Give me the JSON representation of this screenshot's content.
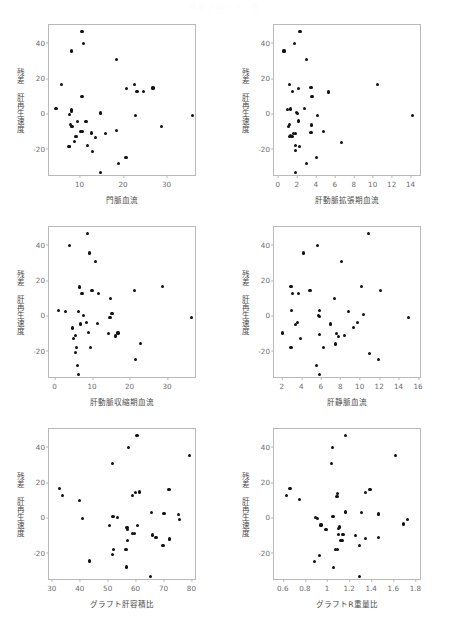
{
  "header": {
    "watermark": "残差プロット一覧"
  },
  "figure": {
    "ylabel_common": "残差 肝再生速度"
  },
  "chart_data": [
    {
      "type": "scatter",
      "title": "",
      "xlabel": "門脈血流",
      "ylabel": "残差 肝再生速度",
      "xlim": [
        3,
        37
      ],
      "ylim": [
        -36,
        50
      ],
      "xticks": [
        10,
        20,
        30
      ],
      "yticks": [
        40,
        20,
        0,
        -20
      ],
      "grid": false,
      "legend": "none",
      "points": [
        [
          10.6,
          46.5
        ],
        [
          10.9,
          39.7
        ],
        [
          8.2,
          35.3
        ],
        [
          18.6,
          30.6
        ],
        [
          5.9,
          16.2
        ],
        [
          22.6,
          16.3
        ],
        [
          20.8,
          14.0
        ],
        [
          26.9,
          14.4
        ],
        [
          23.2,
          12.4
        ],
        [
          24.7,
          12.2
        ],
        [
          10.6,
          9.5
        ],
        [
          4.6,
          2.6
        ],
        [
          8.1,
          2.0
        ],
        [
          8.2,
          1.5
        ],
        [
          8.1,
          0.9
        ],
        [
          14.9,
          0.2
        ],
        [
          7.7,
          -0.7
        ],
        [
          22.9,
          -1.3
        ],
        [
          35.9,
          -1.4
        ],
        [
          9.5,
          -4.4
        ],
        [
          11.5,
          -4.7
        ],
        [
          7.9,
          -6.5
        ],
        [
          8.3,
          -7.2
        ],
        [
          28.9,
          -7.3
        ],
        [
          18.6,
          -9.6
        ],
        [
          10.2,
          -10.2
        ],
        [
          10.6,
          -10.4
        ],
        [
          12.7,
          -11.1
        ],
        [
          16.0,
          -11.4
        ],
        [
          9.2,
          -12.9
        ],
        [
          13.6,
          -13.5
        ],
        [
          8.9,
          -16.1
        ],
        [
          11.9,
          -18.0
        ],
        [
          7.6,
          -18.8
        ],
        [
          7.8,
          -18.9
        ],
        [
          12.9,
          -21.6
        ],
        [
          20.7,
          -25.0
        ],
        [
          18.9,
          -28.2
        ],
        [
          14.8,
          -33.3
        ]
      ]
    },
    {
      "type": "scatter",
      "title": "",
      "xlabel": "肝動脈拡張期血流",
      "ylabel": "残差 肝再生速度",
      "xlim": [
        -0.4,
        15.2
      ],
      "ylim": [
        -36,
        50
      ],
      "xticks": [
        0,
        2,
        4,
        6,
        8,
        10,
        12,
        14
      ],
      "yticks": [
        40,
        20,
        0,
        -20
      ],
      "grid": false,
      "legend": "none",
      "points": [
        [
          2.35,
          46.5
        ],
        [
          1.75,
          39.7
        ],
        [
          0.65,
          35.3
        ],
        [
          3.0,
          30.6
        ],
        [
          1.25,
          16.2
        ],
        [
          10.5,
          16.3
        ],
        [
          2.15,
          14.0
        ],
        [
          3.5,
          14.5
        ],
        [
          1.55,
          12.4
        ],
        [
          5.35,
          12.1
        ],
        [
          3.6,
          9.5
        ],
        [
          1.0,
          2.2
        ],
        [
          1.35,
          2.5
        ],
        [
          2.85,
          2.7
        ],
        [
          1.95,
          0.4
        ],
        [
          2.05,
          0.0
        ],
        [
          14.2,
          -1.2
        ],
        [
          4.2,
          -1.4
        ],
        [
          2.2,
          -4.3
        ],
        [
          1.25,
          -6.4
        ],
        [
          3.55,
          -6.6
        ],
        [
          1.15,
          -7.5
        ],
        [
          4.8,
          -10.2
        ],
        [
          3.5,
          -10.6
        ],
        [
          1.65,
          -11.3
        ],
        [
          1.9,
          -11.5
        ],
        [
          1.3,
          -12.4
        ],
        [
          1.25,
          -13.0
        ],
        [
          1.5,
          -13.3
        ],
        [
          1.85,
          -18.0
        ],
        [
          2.3,
          -18.6
        ],
        [
          6.7,
          -16.3
        ],
        [
          1.9,
          -21.2
        ],
        [
          4.05,
          -25.0
        ],
        [
          3.05,
          -28.3
        ],
        [
          1.85,
          -33.4
        ]
      ]
    },
    {
      "type": "scatter",
      "title": "",
      "xlabel": "肝動脈収縮期血流",
      "ylabel": "残差 肝再生速度",
      "xlim": [
        -1.5,
        38
      ],
      "ylim": [
        -36,
        50
      ],
      "xticks": [
        0,
        10,
        20,
        30
      ],
      "yticks": [
        40,
        20,
        0,
        -20
      ],
      "grid": false,
      "legend": "none",
      "points": [
        [
          8.7,
          46.5
        ],
        [
          3.9,
          39.7
        ],
        [
          9.4,
          35.3
        ],
        [
          11.0,
          30.6
        ],
        [
          28.7,
          16.3
        ],
        [
          6.6,
          16.1
        ],
        [
          10.0,
          14.1
        ],
        [
          21.3,
          14.3
        ],
        [
          7.3,
          12.4
        ],
        [
          11.7,
          12.3
        ],
        [
          14.9,
          9.6
        ],
        [
          1.1,
          2.6
        ],
        [
          3.0,
          2.1
        ],
        [
          6.3,
          2.4
        ],
        [
          15.3,
          1.0
        ],
        [
          7.8,
          -0.2
        ],
        [
          14.8,
          -1.3
        ],
        [
          36.5,
          -1.2
        ],
        [
          8.5,
          -4.2
        ],
        [
          11.5,
          -4.5
        ],
        [
          6.9,
          -4.9
        ],
        [
          4.7,
          -7.1
        ],
        [
          9.1,
          -9.9
        ],
        [
          14.3,
          -10.2
        ],
        [
          16.9,
          -10.0
        ],
        [
          16.2,
          -11.7
        ],
        [
          5.6,
          -11.3
        ],
        [
          5.1,
          -12.9
        ],
        [
          23.0,
          -15.9
        ],
        [
          5.9,
          -18.0
        ],
        [
          9.5,
          -18.2
        ],
        [
          5.5,
          -20.8
        ],
        [
          21.6,
          -24.9
        ],
        [
          6.2,
          -28.3
        ],
        [
          6.4,
          -33.4
        ]
      ]
    },
    {
      "type": "scatter",
      "title": "",
      "xlabel": "肝静脈血流",
      "ylabel": "残差 肝再生速度",
      "xlim": [
        1.2,
        16.4
      ],
      "ylim": [
        -36,
        50
      ],
      "xticks": [
        2,
        4,
        6,
        8,
        10,
        12,
        14,
        16
      ],
      "yticks": [
        40,
        20,
        0,
        -20
      ],
      "grid": false,
      "legend": "none",
      "points": [
        [
          10.9,
          46.5
        ],
        [
          5.7,
          39.7
        ],
        [
          4.2,
          35.3
        ],
        [
          8.1,
          30.5
        ],
        [
          2.95,
          16.2
        ],
        [
          10.2,
          16.2
        ],
        [
          4.9,
          14.2
        ],
        [
          12.1,
          14.3
        ],
        [
          3.1,
          12.4
        ],
        [
          3.7,
          12.3
        ],
        [
          7.4,
          9.5
        ],
        [
          3.0,
          2.7
        ],
        [
          5.85,
          2.6
        ],
        [
          8.85,
          2.2
        ],
        [
          10.4,
          0.6
        ],
        [
          5.8,
          0.0
        ],
        [
          5.9,
          -0.6
        ],
        [
          15.0,
          -1.2
        ],
        [
          3.6,
          -4.2
        ],
        [
          9.75,
          -4.1
        ],
        [
          7.0,
          -4.9
        ],
        [
          3.4,
          -5.0
        ],
        [
          2.1,
          -10.0
        ],
        [
          7.6,
          -10.3
        ],
        [
          5.9,
          -10.7
        ],
        [
          9.4,
          -6.9
        ],
        [
          8.4,
          -11.3
        ],
        [
          7.8,
          -12.0
        ],
        [
          3.9,
          -13.0
        ],
        [
          6.3,
          -18.0
        ],
        [
          2.95,
          -18.2
        ],
        [
          7.5,
          -16.2
        ],
        [
          11.0,
          -21.7
        ],
        [
          11.9,
          -25.0
        ],
        [
          5.6,
          -28.3
        ],
        [
          5.9,
          -33.4
        ]
      ]
    },
    {
      "type": "scatter",
      "title": "",
      "xlabel": "グラフト肝容積比",
      "ylabel": "残差 肝再生速度",
      "xlim": [
        29,
        82
      ],
      "ylim": [
        -36,
        50
      ],
      "xticks": [
        30,
        40,
        50,
        60,
        70,
        80
      ],
      "yticks": [
        40,
        20,
        0,
        -20
      ],
      "grid": false,
      "legend": "none",
      "points": [
        [
          60.5,
          46.5
        ],
        [
          57.5,
          39.7
        ],
        [
          79.2,
          35.2
        ],
        [
          51.6,
          30.5
        ],
        [
          32.9,
          16.4
        ],
        [
          72.0,
          15.9
        ],
        [
          60.0,
          14.2
        ],
        [
          61.4,
          14.4
        ],
        [
          33.8,
          12.4
        ],
        [
          58.9,
          12.3
        ],
        [
          39.9,
          9.5
        ],
        [
          65.7,
          2.6
        ],
        [
          70.2,
          2.4
        ],
        [
          75.3,
          1.6
        ],
        [
          51.9,
          0.6
        ],
        [
          53.4,
          0.0
        ],
        [
          41.0,
          -0.5
        ],
        [
          75.6,
          -1.4
        ],
        [
          60.8,
          -4.7
        ],
        [
          50.6,
          -4.4
        ],
        [
          56.9,
          -5.6
        ],
        [
          57.0,
          -6.9
        ],
        [
          66.2,
          -10.0
        ],
        [
          58.9,
          -9.1
        ],
        [
          59.6,
          -8.9
        ],
        [
          67.3,
          -11.5
        ],
        [
          72.2,
          -12.2
        ],
        [
          57.2,
          -13.3
        ],
        [
          69.8,
          -15.9
        ],
        [
          52.2,
          -18.0
        ],
        [
          56.6,
          -18.1
        ],
        [
          51.8,
          -21.2
        ],
        [
          43.6,
          -24.7
        ],
        [
          56.7,
          -28.1
        ],
        [
          65.4,
          -33.3
        ]
      ]
    },
    {
      "type": "scatter",
      "title": "",
      "xlabel": "グラフトR重量比",
      "ylabel": "残差 肝再生速度",
      "xlim": [
        0.52,
        1.86
      ],
      "ylim": [
        -36,
        50
      ],
      "xticks": [
        0.6,
        0.8,
        1,
        1.2,
        1.4,
        1.6,
        1.8
      ],
      "yticks": [
        40,
        20,
        0,
        -20
      ],
      "grid": false,
      "legend": "none",
      "points": [
        [
          1.17,
          46.5
        ],
        [
          1.05,
          39.7
        ],
        [
          1.62,
          35.2
        ],
        [
          1.04,
          30.6
        ],
        [
          0.665,
          16.2
        ],
        [
          1.39,
          15.8
        ],
        [
          1.345,
          14.2
        ],
        [
          1.095,
          13.5
        ],
        [
          0.635,
          12.3
        ],
        [
          1.09,
          12.0
        ],
        [
          0.75,
          10.0
        ],
        [
          1.165,
          3.0
        ],
        [
          1.31,
          2.9
        ],
        [
          1.465,
          1.9
        ],
        [
          1.055,
          0.5
        ],
        [
          0.895,
          -0.3
        ],
        [
          0.915,
          -0.5
        ],
        [
          1.73,
          -1.3
        ],
        [
          1.69,
          -3.8
        ],
        [
          0.945,
          -4.3
        ],
        [
          1.115,
          -5.5
        ],
        [
          1.105,
          -6.5
        ],
        [
          0.99,
          -7.0
        ],
        [
          1.145,
          -9.6
        ],
        [
          1.105,
          -9.9
        ],
        [
          1.255,
          -10.4
        ],
        [
          1.345,
          -11.9
        ],
        [
          1.465,
          -11.5
        ],
        [
          1.12,
          -12.9
        ],
        [
          1.135,
          -13.2
        ],
        [
          1.075,
          -18.0
        ],
        [
          1.095,
          -18.2
        ],
        [
          1.295,
          -15.9
        ],
        [
          0.93,
          -21.6
        ],
        [
          0.885,
          -25.0
        ],
        [
          1.06,
          -28.3
        ],
        [
          1.295,
          -33.5
        ]
      ]
    }
  ]
}
